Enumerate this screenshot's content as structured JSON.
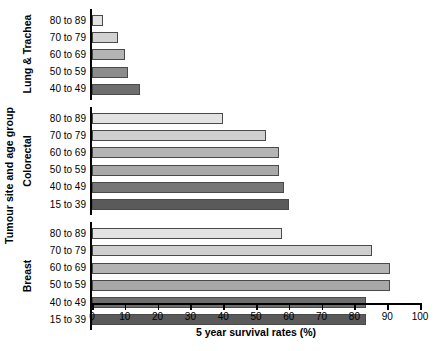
{
  "chart_data": {
    "type": "bar",
    "orientation": "horizontal",
    "title": "",
    "xlabel": "5 year survival rates (%)",
    "ylabel": "Tumour site and age group",
    "xlim": [
      0,
      100
    ],
    "xticks": [
      0,
      10,
      20,
      30,
      40,
      50,
      60,
      70,
      80,
      90,
      100
    ],
    "grid": false,
    "legend": "none",
    "groups": [
      {
        "name": "Lung & Trachea",
        "categories": [
          "80 to 89",
          "70 to 79",
          "60 to 69",
          "50 to 59",
          "40 to 49"
        ],
        "values": [
          3.5,
          8,
          10,
          11,
          14.5
        ],
        "colors": [
          "#e3e3e3",
          "#d2d2d2",
          "#b4b4b4",
          "#8c8c8c",
          "#6e6e6e"
        ]
      },
      {
        "name": "Colorectal",
        "categories": [
          "80 to 89",
          "70 to 79",
          "60 to 69",
          "50 to 59",
          "40 to 49",
          "15 to 39"
        ],
        "values": [
          40,
          53,
          57,
          57,
          58.5,
          60
        ],
        "colors": [
          "#e3e3e3",
          "#cfcfcf",
          "#b4b4b4",
          "#a8a8a8",
          "#767676",
          "#5a5a5a"
        ]
      },
      {
        "name": "Breast",
        "categories": [
          "80 to 89",
          "70 to 79",
          "60 to 69",
          "50 to 59",
          "40 to 49",
          "15 to 39"
        ],
        "values": [
          58,
          85.5,
          91,
          91,
          83.5,
          83.5
        ],
        "colors": [
          "#e3e3e3",
          "#cfcfcf",
          "#b4b4b4",
          "#a8a8a8",
          "#6e6e6e",
          "#5a5a5a"
        ]
      }
    ]
  },
  "axis": {
    "x_title": "5 year survival rates (%)",
    "y_title": "Tumour site and age group",
    "x_tick_labels": [
      "0",
      "10",
      "20",
      "30",
      "40",
      "50",
      "60",
      "70",
      "80",
      "90",
      "100"
    ]
  },
  "groups_meta": [
    {
      "label": "Lung & Trachea"
    },
    {
      "label": "Colorectal"
    },
    {
      "label": "Breast"
    }
  ]
}
